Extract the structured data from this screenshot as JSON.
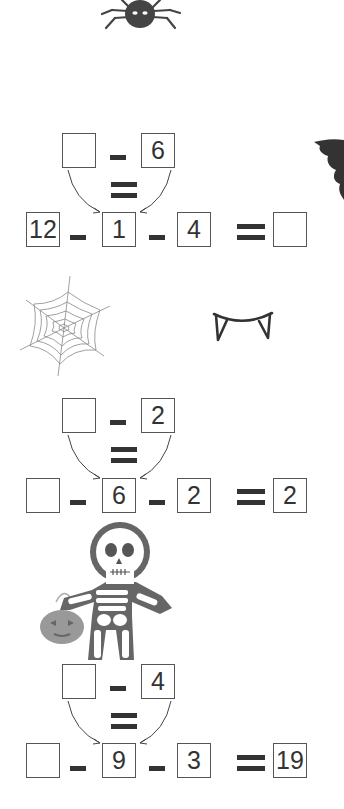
{
  "worksheet": {
    "decorations": [
      "spider-icon",
      "bat-icon",
      "spiderweb-icon",
      "fangs-icon",
      "skeleton-icon",
      "pumpkin-bucket-icon"
    ],
    "colors": {
      "ink": "#333333",
      "box_border": "#555555",
      "spider": "#444444",
      "pumpkin": "#999999"
    },
    "problems": [
      {
        "top": {
          "a": "",
          "b": "6"
        },
        "bottom": {
          "a": "12",
          "b": "1",
          "c": "4",
          "result": ""
        }
      },
      {
        "top": {
          "a": "",
          "b": "2"
        },
        "bottom": {
          "a": "",
          "b": "6",
          "c": "2",
          "result": "2"
        }
      },
      {
        "top": {
          "a": "",
          "b": "4"
        },
        "bottom": {
          "a": "",
          "b": "9",
          "c": "3",
          "result": "19"
        }
      }
    ]
  }
}
